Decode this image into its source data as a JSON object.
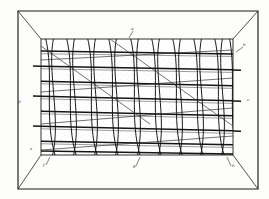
{
  "plate": {
    "title": "WIRE MESH  MOULD",
    "caption_visible": false,
    "ink_color": "#1b1b1b",
    "paper_color": "#fdfdfb",
    "figure_kind": "woven wire mesh frame in perspective"
  },
  "frame": {
    "outer": {
      "left": 18,
      "top": 11,
      "right": 258,
      "bottom": 189
    },
    "inner": {
      "left": 41,
      "top": 39,
      "right": 233,
      "bottom": 155
    },
    "corner_diagonals": 4
  },
  "mesh": {
    "vertical_wire_pairs": 10,
    "horizontal_bars": 8,
    "weave_style": "crossed double wires over horizontal rods",
    "shading": "stippled"
  },
  "labels": [
    {
      "id": "a",
      "text": "a",
      "x": 131,
      "y": 30
    },
    {
      "id": "b",
      "text": "b",
      "x": 243,
      "y": 46
    },
    {
      "id": "c",
      "text": "c",
      "x": 247,
      "y": 101
    },
    {
      "id": "d",
      "text": "d",
      "x": 18,
      "y": 103
    },
    {
      "id": "e",
      "text": "e",
      "x": 30,
      "y": 150
    },
    {
      "id": "f",
      "text": "f",
      "x": 43,
      "y": 166
    },
    {
      "id": "g",
      "text": "g",
      "x": 133,
      "y": 167
    },
    {
      "id": "h",
      "text": "h",
      "x": 232,
      "y": 167
    }
  ]
}
